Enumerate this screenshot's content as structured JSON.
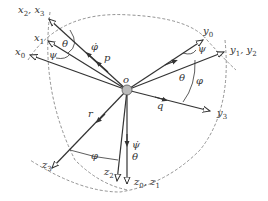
{
  "diagram": {
    "origin_label": "o",
    "axes": {
      "x0": "x",
      "x1": "x",
      "x23": "x",
      "y0": "y",
      "y12": "y",
      "y3": "y",
      "z01": "z",
      "z2": "z",
      "z3": "z"
    },
    "subscripts": {
      "x0": "0",
      "x1": "1",
      "x2": "2",
      "x3": "3",
      "y0": "0",
      "y1": "1",
      "y2": "2",
      "y3": "3",
      "z0": "0",
      "z1": "1",
      "z2": "2",
      "z3": "3"
    },
    "separator": ", ",
    "vectors": {
      "p": "p",
      "q": "q",
      "r": "r"
    },
    "angles": {
      "theta": "θ",
      "psi": "ψ",
      "phi": "φ"
    },
    "rates": {
      "phi_dot": "φ̇",
      "psi_dot": "ψ̇",
      "theta_dot": "θ"
    },
    "colors": {
      "line": "#333333",
      "dash": "#777777",
      "origin_fill": "#bbbbbb"
    }
  }
}
